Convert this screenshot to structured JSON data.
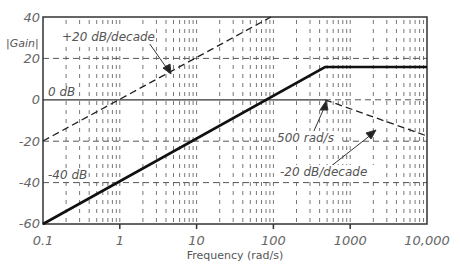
{
  "chart_data": {
    "type": "line",
    "title": "",
    "xlabel": "Frequency (rad/s)",
    "ylabel": "|Gain|",
    "xscale": "log",
    "xlim": [
      0.1,
      10000
    ],
    "ylim": [
      -60,
      40
    ],
    "grid": true,
    "x_ticks": [
      "0.1",
      "1",
      "10",
      "100",
      "1000",
      "10,000"
    ],
    "y_ticks": [
      "40",
      "20",
      "0",
      "-20",
      "-40",
      "-60"
    ],
    "series": [
      {
        "name": "composite gain",
        "style": "solid",
        "points": [
          [
            0.1,
            -60
          ],
          [
            500,
            14
          ],
          [
            10000,
            14
          ]
        ]
      },
      {
        "name": "+20 dB/decade asymptote",
        "style": "dashed",
        "points": [
          [
            0.1,
            -20
          ],
          [
            25,
            40
          ]
        ]
      },
      {
        "name": "-20 dB/decade asymptote",
        "style": "dashed",
        "points": [
          [
            500,
            0
          ],
          [
            10000,
            -26
          ]
        ]
      },
      {
        "name": "0 dB reference",
        "style": "solid-thin",
        "points": [
          [
            0.1,
            0
          ],
          [
            500,
            0
          ]
        ]
      }
    ],
    "annotations": [
      {
        "text": "+20 dB/decade",
        "target": "+20 dB/decade asymptote"
      },
      {
        "text": "0 dB",
        "at": [
          0.1,
          0
        ]
      },
      {
        "text": "500 rad/s",
        "target": [
          500,
          0
        ]
      },
      {
        "text": "-20 dB/decade",
        "target": "-20 dB/decade asymptote"
      },
      {
        "text": "-40 dB",
        "at": [
          0.1,
          -40
        ]
      }
    ]
  },
  "labels": {
    "ylabel": "|Gain|",
    "xlabel": "Frequency (rad/s)",
    "x_ticks": [
      "0.1",
      "1",
      "10",
      "100",
      "1000",
      "10,000"
    ],
    "y_ticks": [
      "40",
      "20",
      "0",
      "-20",
      "-40",
      "-60"
    ],
    "ann_plus20": "+20 dB/decade",
    "ann_0db": "0 dB",
    "ann_500": "500 rad/s",
    "ann_minus20": "-20 dB/decade",
    "ann_minus40": "-40 dB"
  }
}
